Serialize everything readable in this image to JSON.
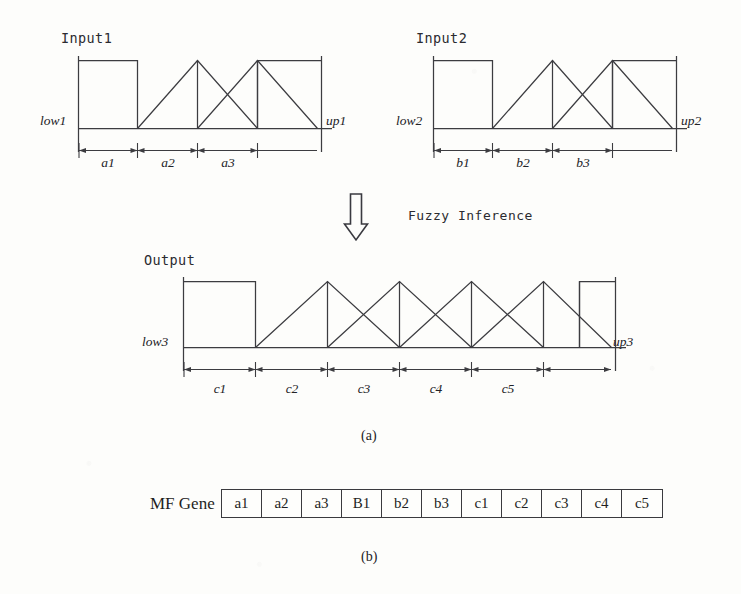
{
  "figure": {
    "panel_a_caption": "(a)",
    "panel_b_caption": "(b)"
  },
  "inference": {
    "label": "Fuzzy Inference",
    "arrow_icon": "down-arrow-hollow-icon"
  },
  "input1": {
    "title": "Input1",
    "low_label": "low1",
    "up_label": "up1",
    "segments": [
      {
        "label": "a1"
      },
      {
        "label": "a2"
      },
      {
        "label": "a3"
      }
    ]
  },
  "input2": {
    "title": "Input2",
    "low_label": "low2",
    "up_label": "up2",
    "segments": [
      {
        "label": "b1"
      },
      {
        "label": "b2"
      },
      {
        "label": "b3"
      }
    ]
  },
  "output": {
    "title": "Output",
    "low_label": "low3",
    "up_label": "up3",
    "segments": [
      {
        "label": "c1"
      },
      {
        "label": "c2"
      },
      {
        "label": "c3"
      },
      {
        "label": "c4"
      },
      {
        "label": "c5"
      }
    ]
  },
  "mf_gene": {
    "title": "MF Gene",
    "cells": [
      "a1",
      "a2",
      "a3",
      "B1",
      "b2",
      "b3",
      "c1",
      "c2",
      "c3",
      "c4",
      "c5"
    ]
  },
  "colors": {
    "line": "#3c3c40",
    "text": "#222226",
    "background": "#fdfdfb"
  }
}
